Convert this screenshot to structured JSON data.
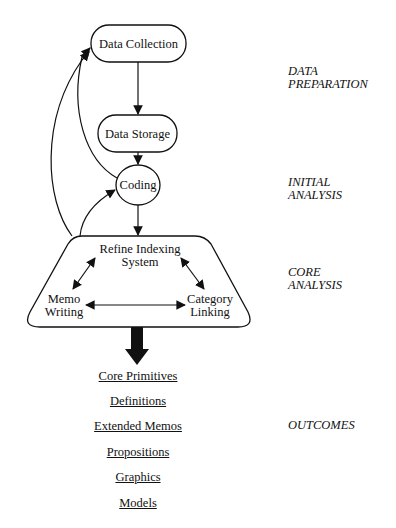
{
  "nodes": {
    "data_collection": "Data Collection",
    "data_storage": "Data Storage",
    "coding": "Coding",
    "refine_indexing_line1": "Refine Indexing",
    "refine_indexing_line2": "System",
    "memo_writing_line1": "Memo",
    "memo_writing_line2": "Writing",
    "category_linking_line1": "Category",
    "category_linking_line2": "Linking"
  },
  "stages": {
    "data_preparation": "DATA\nPREPARATION",
    "initial_analysis": "INITIAL\nANALYSIS",
    "core_analysis": "CORE\nANALYSIS",
    "outcomes": "OUTCOMES"
  },
  "outcomes": [
    "Core Primitives",
    "Definitions",
    "Extended Memos",
    "Propositions",
    "Graphics",
    "Models"
  ]
}
